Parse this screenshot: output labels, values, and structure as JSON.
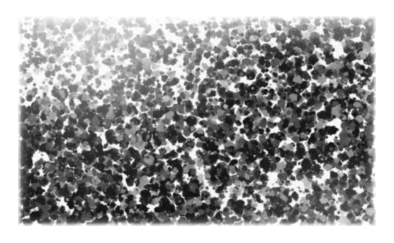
{
  "figure": {
    "kind": "grayscale-micrograph",
    "caption": "",
    "label": "",
    "scale_bar": "",
    "annotations": []
  },
  "page": {
    "width": 394,
    "height": 243,
    "background_color": "#ffffff"
  },
  "plate": {
    "x": 18,
    "y": 16,
    "width": 358,
    "height": 210,
    "background_color": "#fbfbfb",
    "border": "none"
  },
  "palette": {
    "paper_white": "#ffffff",
    "field_light": "#f7f7f7",
    "nucleus_dark": "#141414",
    "nucleus_mid": "#4a4a4a",
    "nucleus_light": "#8e8e8e",
    "shadow_gray": "#b9b9b9"
  },
  "texture": {
    "seed": 20481,
    "blob_count": 4200,
    "blob_min_radius": 1.4,
    "blob_max_radius": 4.6,
    "blur_radius_px": 0.65,
    "grain_opacity": 0.1,
    "density_map_note": "sparser and lighter across the top strip and upper-left corner; densest and darkest in the lower-left quadrant and the mid-right band",
    "density_regions": [
      {
        "name": "top-strip",
        "cx": 0.5,
        "cy": 0.05,
        "weight": 0.42
      },
      {
        "name": "upper-left",
        "cx": 0.14,
        "cy": 0.18,
        "weight": 0.5
      },
      {
        "name": "upper-center",
        "cx": 0.45,
        "cy": 0.2,
        "weight": 0.72
      },
      {
        "name": "upper-right",
        "cx": 0.85,
        "cy": 0.22,
        "weight": 0.88
      },
      {
        "name": "mid-left",
        "cx": 0.16,
        "cy": 0.55,
        "weight": 0.95
      },
      {
        "name": "center",
        "cx": 0.5,
        "cy": 0.55,
        "weight": 0.9
      },
      {
        "name": "mid-right",
        "cx": 0.84,
        "cy": 0.5,
        "weight": 1.0
      },
      {
        "name": "lower-left",
        "cx": 0.2,
        "cy": 0.82,
        "weight": 1.0
      },
      {
        "name": "lower-center",
        "cx": 0.52,
        "cy": 0.85,
        "weight": 0.9
      },
      {
        "name": "lower-right",
        "cx": 0.86,
        "cy": 0.84,
        "weight": 0.86
      }
    ]
  }
}
